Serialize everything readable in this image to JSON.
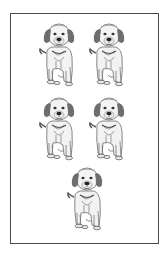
{
  "worksheet": {
    "title": "",
    "item_name": "puppy",
    "count": 5,
    "layout": "2-2-1 grid",
    "items": [
      {
        "label": "puppy",
        "row": 1,
        "col": 1
      },
      {
        "label": "puppy",
        "row": 1,
        "col": 2
      },
      {
        "label": "puppy",
        "row": 2,
        "col": 1
      },
      {
        "label": "puppy",
        "row": 2,
        "col": 2
      },
      {
        "label": "puppy",
        "row": 3,
        "col": 1
      }
    ],
    "colors": {
      "border": "#4a4a4a",
      "background": "#ffffff",
      "ink_dark": "#3a3a3a",
      "ink_mid": "#8a8a8a",
      "ink_light": "#c8c8c8"
    }
  }
}
